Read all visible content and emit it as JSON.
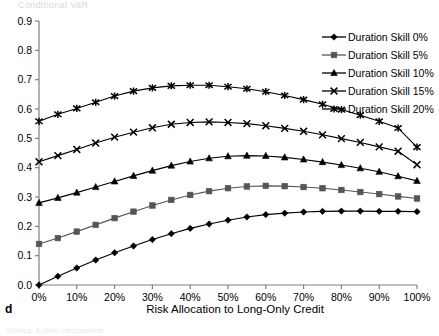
{
  "figure": {
    "panel_letter": "d",
    "top_cropped_text": "Conditional VaR",
    "bottom_faint_text": "Source: Author calculations"
  },
  "chart_data": {
    "type": "line",
    "title": "",
    "xlabel": "Risk Allocation to Long-Only Credit",
    "ylabel": "",
    "xlim": [
      0,
      100
    ],
    "ylim": [
      0,
      0.9
    ],
    "grid": false,
    "legend_position": "top-right",
    "x_tick_labels": [
      "0%",
      "10%",
      "20%",
      "30%",
      "40%",
      "50%",
      "60%",
      "70%",
      "80%",
      "90%",
      "100%"
    ],
    "x_tick_values": [
      0,
      10,
      20,
      30,
      40,
      50,
      60,
      70,
      80,
      90,
      100
    ],
    "y_tick_labels": [
      "0.0",
      "0.1",
      "0.2",
      "0.3",
      "0.4",
      "0.5",
      "0.6",
      "0.7",
      "0.8",
      "0.9"
    ],
    "y_tick_values": [
      0.0,
      0.1,
      0.2,
      0.3,
      0.4,
      0.5,
      0.6,
      0.7,
      0.8,
      0.9
    ],
    "x": [
      0,
      5,
      10,
      15,
      20,
      25,
      30,
      35,
      40,
      45,
      50,
      55,
      60,
      65,
      70,
      75,
      80,
      85,
      90,
      95,
      100
    ],
    "series": [
      {
        "name": "Duration Skill 0%",
        "marker": "diamond",
        "color": "#000000",
        "values": [
          0.0,
          0.03,
          0.058,
          0.085,
          0.11,
          0.133,
          0.155,
          0.175,
          0.193,
          0.208,
          0.221,
          0.232,
          0.24,
          0.245,
          0.249,
          0.251,
          0.252,
          0.252,
          0.251,
          0.251,
          0.25
        ]
      },
      {
        "name": "Duration Skill 5%",
        "marker": "square",
        "color": "#555555",
        "values": [
          0.14,
          0.16,
          0.182,
          0.205,
          0.228,
          0.25,
          0.271,
          0.29,
          0.307,
          0.32,
          0.33,
          0.336,
          0.338,
          0.337,
          0.334,
          0.33,
          0.324,
          0.317,
          0.31,
          0.302,
          0.295
        ]
      },
      {
        "name": "Duration Skill 10%",
        "marker": "triangle",
        "color": "#000000",
        "values": [
          0.28,
          0.297,
          0.315,
          0.334,
          0.353,
          0.372,
          0.39,
          0.407,
          0.421,
          0.432,
          0.439,
          0.441,
          0.44,
          0.435,
          0.428,
          0.419,
          0.409,
          0.398,
          0.386,
          0.371,
          0.355
        ]
      },
      {
        "name": "Duration Skill 15%",
        "marker": "cross",
        "color": "#000000",
        "values": [
          0.42,
          0.441,
          0.462,
          0.484,
          0.504,
          0.521,
          0.536,
          0.548,
          0.554,
          0.556,
          0.554,
          0.55,
          0.543,
          0.534,
          0.524,
          0.512,
          0.499,
          0.486,
          0.471,
          0.456,
          0.41
        ]
      },
      {
        "name": "Duration Skill 20%",
        "marker": "asterisk",
        "color": "#000000",
        "values": [
          0.558,
          0.582,
          0.602,
          0.623,
          0.644,
          0.661,
          0.672,
          0.679,
          0.681,
          0.681,
          0.676,
          0.669,
          0.659,
          0.646,
          0.632,
          0.616,
          0.598,
          0.579,
          0.558,
          0.535,
          0.47
        ]
      }
    ]
  },
  "legend": {
    "items": [
      {
        "label": "Duration Skill 0%",
        "marker": "diamond"
      },
      {
        "label": "Duration Skill 5%",
        "marker": "square"
      },
      {
        "label": "Duration Skill 10%",
        "marker": "triangle"
      },
      {
        "label": "Duration Skill 15%",
        "marker": "cross"
      },
      {
        "label": "Duration Skill 20%",
        "marker": "asterisk"
      }
    ]
  }
}
